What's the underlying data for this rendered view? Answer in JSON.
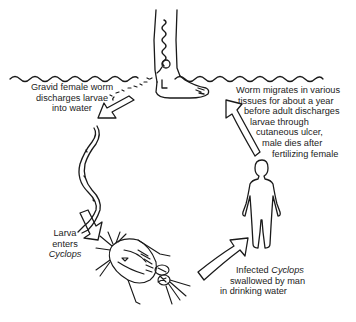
{
  "diagram": {
    "labels": {
      "discharge": {
        "lines": [
          "Gravid female worm",
          "discharges larvae",
          "into water"
        ]
      },
      "migrate": {
        "lines": [
          "Worm migrates  in various",
          "tissues for about a year",
          "before  adult discharges",
          "larvae  through",
          "cutaneous ulcer,",
          "male dies after",
          "fertilizing female"
        ]
      },
      "larva": {
        "line1": "Larva",
        "line2": "enters",
        "line3_italic": "Cyclops"
      },
      "swallow": {
        "line1_prefix": "Infected ",
        "line1_italic": "Cyclops",
        "line2": "swallowed by  man",
        "line3": "in drinking water"
      }
    },
    "figures": [
      "human-leg-with-worm",
      "water-surface",
      "larva-worm",
      "cyclops-copepod",
      "human-silhouette"
    ],
    "arrows": [
      "water-to-larva",
      "larva-to-cyclops",
      "cyclops-to-human",
      "human-to-leg"
    ],
    "colors": {
      "ink": "#1a1a1a",
      "background": "#ffffff"
    }
  }
}
